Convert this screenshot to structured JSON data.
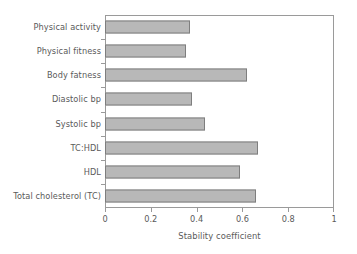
{
  "chart_data": {
    "type": "bar",
    "orientation": "horizontal",
    "title": "",
    "xlabel": "Stability coefficient",
    "ylabel": "",
    "xlim": [
      0,
      1
    ],
    "xticks": [
      "0",
      "0.2",
      "0.4",
      "0.6",
      "0.8",
      "1"
    ],
    "xtick_values": [
      0,
      0.2,
      0.4,
      0.6,
      0.8,
      1
    ],
    "grid": false,
    "legend": null,
    "categories": [
      "Physical activity",
      "Physical fitness",
      "Body fatness",
      "Diastolic bp",
      "Systolic bp",
      "TC:HDL",
      "HDL",
      "Total cholesterol (TC)"
    ],
    "values": [
      0.37,
      0.355,
      0.62,
      0.38,
      0.435,
      0.67,
      0.59,
      0.66
    ],
    "bar_fill_color": "#b8b8b8",
    "bar_border_color": "#7e7e7e",
    "axis_color": "#9a9a9a",
    "text_color": "#5a5a5a"
  }
}
